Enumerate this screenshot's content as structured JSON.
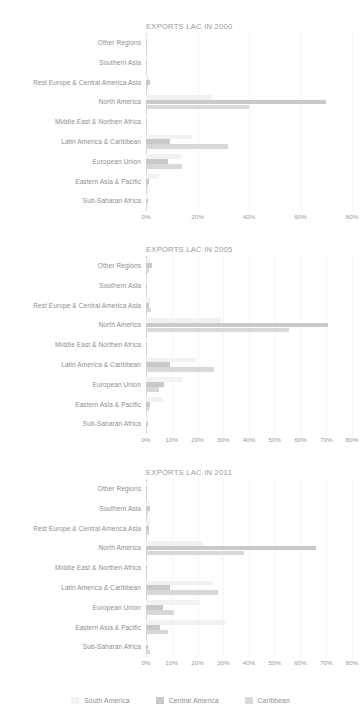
{
  "page": {
    "background": "#ffffff",
    "width": 361,
    "height": 722
  },
  "legend": {
    "items": [
      {
        "label": "South America",
        "color": "#f2f2f2",
        "name": "legend-south-america"
      },
      {
        "label": "Central America",
        "color": "#c9c9c9",
        "name": "legend-central-america"
      },
      {
        "label": "Caribbean",
        "color": "#d8d8d8",
        "name": "legend-caribbean"
      }
    ]
  },
  "categories": [
    "Other Regions",
    "Southern Asia",
    "Rest Europe & Central America Asia",
    "North America",
    "Middle East & Northen Africa",
    "Latin America & Caribbean",
    "European Union",
    "Eastern Asia & Pacific",
    "Sub-Saharan Africa"
  ],
  "chart_data": [
    {
      "type": "bar",
      "orientation": "horizontal",
      "grouped": true,
      "title": "EXPORTS LAC IN 2000",
      "xlabel": "",
      "ylabel": "",
      "xlim": [
        0,
        80
      ],
      "xticks": [
        0,
        20,
        40,
        60,
        80
      ],
      "xticklabels": [
        "0%",
        "20%",
        "40%",
        "60%",
        "80%"
      ],
      "grid": true,
      "legend_position": "bottom",
      "categories": [
        "Other Regions",
        "Southern Asia",
        "Rest Europe & Central America Asia",
        "North America",
        "Middle East & Northen Africa",
        "Latin America & Caribbean",
        "European Union",
        "Eastern Asia & Pacific",
        "Sub-Saharan Africa"
      ],
      "series": [
        {
          "name": "South America",
          "color": "#f2f2f2",
          "values": [
            0.6,
            0.4,
            1.0,
            25.5,
            0.5,
            18.0,
            13.5,
            5.0,
            0.8
          ]
        },
        {
          "name": "Central America",
          "color": "#c9c9c9",
          "values": [
            0.5,
            0.3,
            1.5,
            70.0,
            0.4,
            9.5,
            8.5,
            1.2,
            0.6
          ]
        },
        {
          "name": "Caribbean",
          "color": "#d8d8d8",
          "values": [
            0.4,
            0.3,
            0.8,
            40.0,
            0.3,
            32.0,
            14.0,
            0.8,
            0.5
          ]
        }
      ]
    },
    {
      "type": "bar",
      "orientation": "horizontal",
      "grouped": true,
      "title": "EXPORTS LAC IN 2005",
      "xlabel": "",
      "ylabel": "",
      "xlim": [
        0,
        80
      ],
      "xticks": [
        0,
        10,
        20,
        30,
        40,
        50,
        60,
        70,
        80
      ],
      "xticklabels": [
        "0%",
        "10%",
        "20%",
        "30%",
        "40%",
        "50%",
        "60%",
        "70%",
        "80%"
      ],
      "grid": true,
      "legend_position": "bottom",
      "categories": [
        "Other Regions",
        "Southern Asia",
        "Rest Europe & Central America Asia",
        "North America",
        "Middle East & Northen Africa",
        "Latin America & Caribbean",
        "European Union",
        "Eastern Asia & Pacific",
        "Sub-Saharan Africa"
      ],
      "series": [
        {
          "name": "South America",
          "color": "#f2f2f2",
          "values": [
            1.5,
            0.5,
            1.5,
            29.0,
            0.6,
            19.5,
            14.0,
            6.5,
            0.8
          ]
        },
        {
          "name": "Central America",
          "color": "#c9c9c9",
          "values": [
            2.2,
            0.4,
            1.2,
            70.5,
            0.4,
            9.5,
            7.0,
            1.5,
            0.6
          ]
        },
        {
          "name": "Caribbean",
          "color": "#d8d8d8",
          "values": [
            1.0,
            0.3,
            1.8,
            55.5,
            0.3,
            26.5,
            5.0,
            1.0,
            0.5
          ]
        }
      ]
    },
    {
      "type": "bar",
      "orientation": "horizontal",
      "grouped": true,
      "title": "EXPORTS LAC IN 2011",
      "xlabel": "",
      "ylabel": "",
      "xlim": [
        0,
        80
      ],
      "xticks": [
        0,
        10,
        20,
        30,
        40,
        50,
        60,
        70,
        80
      ],
      "xticklabels": [
        "0%",
        "10%",
        "20%",
        "30%",
        "40%",
        "50%",
        "60%",
        "70%",
        "80%"
      ],
      "grid": true,
      "legend_position": "bottom",
      "categories": [
        "Other Regions",
        "Southern Asia",
        "Rest Europe & Central America Asia",
        "North America",
        "Middle East & Northen Africa",
        "Latin America & Caribbean",
        "European Union",
        "Eastern Asia & Pacific",
        "Sub-Saharan Africa"
      ],
      "series": [
        {
          "name": "South America",
          "color": "#f2f2f2",
          "values": [
            0.6,
            1.2,
            1.5,
            22.0,
            0.6,
            26.0,
            21.0,
            30.5,
            0.8
          ]
        },
        {
          "name": "Central America",
          "color": "#c9c9c9",
          "values": [
            0.5,
            1.5,
            1.0,
            66.0,
            0.5,
            9.5,
            6.5,
            5.5,
            0.8
          ]
        },
        {
          "name": "Caribbean",
          "color": "#d8d8d8",
          "values": [
            0.4,
            0.8,
            1.2,
            38.0,
            0.4,
            28.0,
            11.0,
            8.5,
            1.5
          ]
        }
      ]
    }
  ]
}
